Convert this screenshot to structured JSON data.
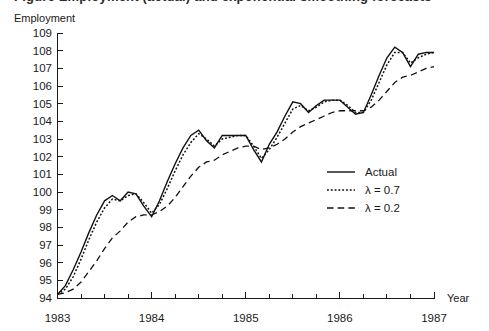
{
  "figure": {
    "clipped_header_text": "Figure  Employment (actual) and exponential smoothing forecasts",
    "background_color": "#ffffff",
    "ink_color": "#111111"
  },
  "chart_data": {
    "type": "line",
    "title": "",
    "xlabel": "Year",
    "ylabel": "Employment",
    "ylim": [
      94,
      109
    ],
    "xlim": [
      1983.0,
      1987.0
    ],
    "ytick_labels": [
      "94",
      "95",
      "96",
      "97",
      "98",
      "99",
      "100",
      "101",
      "102",
      "103",
      "104",
      "105",
      "106",
      "107",
      "108",
      "109"
    ],
    "ytick_values": [
      94,
      95,
      96,
      97,
      98,
      99,
      100,
      101,
      102,
      103,
      104,
      105,
      106,
      107,
      108,
      109
    ],
    "xtick_labels": [
      "1983",
      "1984",
      "1985",
      "1986",
      "1987"
    ],
    "xtick_values": [
      1983,
      1984,
      1985,
      1986,
      1987
    ],
    "minor_xticks_per_year": 4,
    "grid": false,
    "legend_position": "center-right",
    "x": [
      1983.0,
      1983.0833,
      1983.1667,
      1983.25,
      1983.3333,
      1983.4167,
      1983.5,
      1983.5833,
      1983.6667,
      1983.75,
      1983.8333,
      1983.9167,
      1984.0,
      1984.0833,
      1984.1667,
      1984.25,
      1984.3333,
      1984.4167,
      1984.5,
      1984.5833,
      1984.6667,
      1984.75,
      1984.8333,
      1984.9167,
      1985.0,
      1985.0833,
      1985.1667,
      1985.25,
      1985.3333,
      1985.4167,
      1985.5,
      1985.5833,
      1985.6667,
      1985.75,
      1985.8333,
      1985.9167,
      1986.0,
      1986.0833,
      1986.1667,
      1986.25,
      1986.3333,
      1986.4167,
      1986.5,
      1986.5833,
      1986.6667,
      1986.75,
      1986.8333,
      1986.9167,
      1987.0
    ],
    "series": [
      {
        "name": "Actual",
        "style": "solid",
        "color": "#111111",
        "values": [
          94.2,
          94.7,
          95.6,
          96.6,
          97.7,
          98.7,
          99.5,
          99.8,
          99.5,
          100.0,
          99.9,
          99.2,
          98.6,
          99.5,
          100.6,
          101.6,
          102.5,
          103.2,
          103.5,
          102.9,
          102.5,
          103.2,
          103.2,
          103.2,
          103.2,
          102.4,
          101.7,
          102.7,
          103.4,
          104.3,
          105.1,
          105.0,
          104.5,
          104.9,
          105.2,
          105.2,
          105.2,
          104.8,
          104.4,
          104.5,
          105.5,
          106.6,
          107.6,
          108.2,
          107.9,
          107.1,
          107.8,
          107.9,
          107.9
        ]
      },
      {
        "name": "λ = 0.7",
        "style": "dotted",
        "color": "#111111",
        "values": [
          94.2,
          94.5,
          95.2,
          96.2,
          97.3,
          98.3,
          99.1,
          99.6,
          99.5,
          99.8,
          99.9,
          99.4,
          98.8,
          99.3,
          100.2,
          101.2,
          102.1,
          102.8,
          103.3,
          103.0,
          102.6,
          103.0,
          103.1,
          103.2,
          103.2,
          102.6,
          101.9,
          102.4,
          103.1,
          103.9,
          104.7,
          104.9,
          104.6,
          104.8,
          105.1,
          105.2,
          105.2,
          104.9,
          104.5,
          104.5,
          105.2,
          106.2,
          107.2,
          107.9,
          107.9,
          107.3,
          107.6,
          107.8,
          107.9
        ]
      },
      {
        "name": "λ = 0.2",
        "style": "dashed",
        "color": "#111111",
        "values": [
          94.2,
          94.3,
          94.5,
          94.9,
          95.5,
          96.1,
          96.8,
          97.4,
          97.8,
          98.3,
          98.6,
          98.7,
          98.7,
          98.9,
          99.2,
          99.7,
          100.3,
          100.9,
          101.4,
          101.7,
          101.8,
          102.1,
          102.3,
          102.5,
          102.6,
          102.6,
          102.4,
          102.5,
          102.7,
          103.0,
          103.4,
          103.7,
          103.9,
          104.1,
          104.3,
          104.5,
          104.6,
          104.6,
          104.6,
          104.6,
          104.8,
          105.2,
          105.7,
          106.2,
          106.5,
          106.6,
          106.8,
          107.0,
          107.1
        ]
      }
    ]
  },
  "legend": {
    "items": [
      {
        "label": "Actual",
        "style": "solid"
      },
      {
        "label": "λ = 0.7",
        "style": "dotted"
      },
      {
        "label": "λ = 0.2",
        "style": "dashed"
      }
    ]
  }
}
